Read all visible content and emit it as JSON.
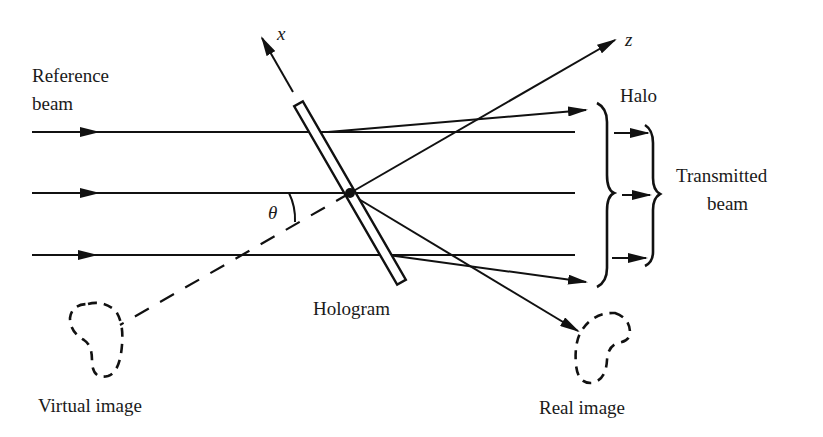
{
  "diagram": {
    "labels": {
      "reference_beam_line1": "Reference",
      "reference_beam_line2": "beam",
      "x_axis": "x",
      "z_axis": "z",
      "theta": "θ",
      "halo": "Halo",
      "transmitted_beam_line1": "Transmitted",
      "transmitted_beam_line2": "beam",
      "hologram": "Hologram",
      "virtual_image": "Virtual image",
      "real_image": "Real image"
    },
    "elements": [
      {
        "id": "reference-beams",
        "description": "Three parallel horizontal incident rays with arrowheads, entering from the left"
      },
      {
        "id": "hologram-plate",
        "description": "Thin tilted rectangular plate crossing the beams"
      },
      {
        "id": "x-axis",
        "description": "Axis along the plate, arrow pointing up-left"
      },
      {
        "id": "z-axis",
        "description": "Axis through plate centre, arrow pointing up-right; dashed extension back toward virtual image"
      },
      {
        "id": "angle-theta",
        "description": "Angle between horizontal beam and z-axis"
      },
      {
        "id": "halo-rays",
        "description": "Diverging rays above and below the transmitted beam, grouped by outer brace"
      },
      {
        "id": "transmitted-beam",
        "description": "Three undeviated arrows grouped by inner brace"
      },
      {
        "id": "real-image-ray",
        "description": "Ray from plate centre down-right to the real image"
      },
      {
        "id": "virtual-image",
        "description": "Dashed kidney-shaped outline at lower left"
      },
      {
        "id": "real-image",
        "description": "Dashed kidney-shaped outline at lower right"
      }
    ],
    "colors": {
      "ink": "#111111",
      "background": "#ffffff"
    }
  }
}
